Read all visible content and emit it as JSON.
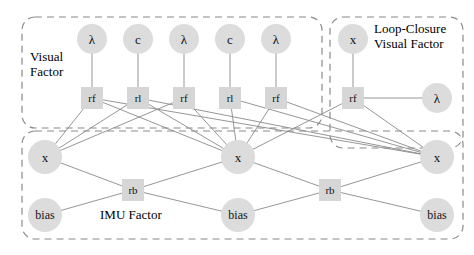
{
  "figure": {
    "width": 474,
    "height": 255,
    "background": "#ffffff",
    "node_fill_circle": "#dcdcdc",
    "node_fill_square": "#d6d6d6",
    "edge_color": "#8a8a8a",
    "group_border_color": "#8a8a8a"
  },
  "groups": [
    {
      "id": "visual-factor",
      "label": "Visual\nFactor",
      "x": 22,
      "y": 17,
      "w": 300,
      "h": 111,
      "label_x": 30,
      "label_y": 50,
      "font_size": 13
    },
    {
      "id": "loop-closure-visual-factor",
      "label": "Loop-Closure\nVisual Factor",
      "x": 330,
      "y": 17,
      "w": 133,
      "h": 131,
      "label_x": 374,
      "label_y": 22,
      "font_size": 13
    },
    {
      "id": "imu-factor",
      "label": "IMU Factor",
      "x": 22,
      "y": 131,
      "w": 441,
      "h": 108,
      "label_x": 100,
      "label_y": 208,
      "font_size": 13
    }
  ],
  "nodes": [
    {
      "id": "lambda1",
      "label": "λ",
      "shape": "circle",
      "cx": 92,
      "cy": 39,
      "r": 15,
      "font_size": 13
    },
    {
      "id": "c1",
      "label": "c",
      "shape": "circle",
      "cx": 138,
      "cy": 39,
      "r": 15,
      "font_size": 13
    },
    {
      "id": "lambda2",
      "label": "λ",
      "shape": "circle",
      "cx": 184,
      "cy": 39,
      "r": 15,
      "font_size": 13
    },
    {
      "id": "c2",
      "label": "c",
      "shape": "circle",
      "cx": 230,
      "cy": 39,
      "r": 15,
      "font_size": 13
    },
    {
      "id": "lambda3",
      "label": "λ",
      "shape": "circle",
      "cx": 276,
      "cy": 39,
      "r": 15,
      "font_size": 13
    },
    {
      "id": "rf1",
      "label": "rf",
      "shape": "square",
      "cx": 92,
      "cy": 98,
      "r": 11,
      "font_size": 11
    },
    {
      "id": "rl1",
      "label": "rl",
      "shape": "square",
      "cx": 138,
      "cy": 98,
      "r": 11,
      "font_size": 11
    },
    {
      "id": "rf2",
      "label": "rf",
      "shape": "square",
      "cx": 184,
      "cy": 98,
      "r": 11,
      "font_size": 11
    },
    {
      "id": "rl2",
      "label": "rl",
      "shape": "square",
      "cx": 230,
      "cy": 98,
      "r": 11,
      "font_size": 11
    },
    {
      "id": "rf3",
      "label": "rf",
      "shape": "square",
      "cx": 276,
      "cy": 98,
      "r": 11,
      "font_size": 11
    },
    {
      "id": "xlc",
      "label": "x",
      "shape": "circle",
      "cx": 353,
      "cy": 39,
      "r": 15,
      "font_size": 13
    },
    {
      "id": "rflc",
      "label": "rf",
      "shape": "square",
      "cx": 353,
      "cy": 98,
      "r": 11,
      "font_size": 11
    },
    {
      "id": "lambdalc",
      "label": "λ",
      "shape": "circle",
      "cx": 437,
      "cy": 98,
      "r": 15,
      "font_size": 13
    },
    {
      "id": "x1",
      "label": "x",
      "shape": "circle",
      "cx": 45,
      "cy": 157,
      "r": 17,
      "font_size": 13
    },
    {
      "id": "x2",
      "label": "x",
      "shape": "circle",
      "cx": 238,
      "cy": 157,
      "r": 17,
      "font_size": 13
    },
    {
      "id": "x3",
      "label": "x",
      "shape": "circle",
      "cx": 437,
      "cy": 157,
      "r": 17,
      "font_size": 13
    },
    {
      "id": "rb1",
      "label": "rb",
      "shape": "square",
      "cx": 133,
      "cy": 190,
      "r": 11,
      "font_size": 11
    },
    {
      "id": "rb2",
      "label": "rb",
      "shape": "square",
      "cx": 330,
      "cy": 190,
      "r": 11,
      "font_size": 11
    },
    {
      "id": "bias1",
      "label": "bias",
      "shape": "circle",
      "cx": 45,
      "cy": 215,
      "r": 17,
      "font_size": 12
    },
    {
      "id": "bias2",
      "label": "bias",
      "shape": "circle",
      "cx": 238,
      "cy": 215,
      "r": 17,
      "font_size": 12
    },
    {
      "id": "bias3",
      "label": "bias",
      "shape": "circle",
      "cx": 437,
      "cy": 215,
      "r": 17,
      "font_size": 12
    }
  ],
  "edges": [
    {
      "from": "lambda1",
      "to": "rf1"
    },
    {
      "from": "c1",
      "to": "rl1"
    },
    {
      "from": "lambda2",
      "to": "rf2"
    },
    {
      "from": "c2",
      "to": "rl2"
    },
    {
      "from": "lambda3",
      "to": "rf3"
    },
    {
      "from": "rf1",
      "to": "x1"
    },
    {
      "from": "rf1",
      "to": "x2"
    },
    {
      "from": "rl1",
      "to": "x1"
    },
    {
      "from": "rl1",
      "to": "x2"
    },
    {
      "from": "rf2",
      "to": "x1"
    },
    {
      "from": "rf2",
      "to": "x2"
    },
    {
      "from": "rl2",
      "to": "x2"
    },
    {
      "from": "rl2",
      "to": "x3"
    },
    {
      "from": "rf3",
      "to": "x2"
    },
    {
      "from": "rf3",
      "to": "x3"
    },
    {
      "from": "rf1",
      "to": "x3"
    },
    {
      "from": "rl1",
      "to": "x3"
    },
    {
      "from": "xlc",
      "to": "rflc"
    },
    {
      "from": "rflc",
      "to": "lambdalc"
    },
    {
      "from": "rflc",
      "to": "x2"
    },
    {
      "from": "rflc",
      "to": "x3"
    },
    {
      "from": "x1",
      "to": "rb1"
    },
    {
      "from": "rb1",
      "to": "x2"
    },
    {
      "from": "bias1",
      "to": "rb1"
    },
    {
      "from": "rb1",
      "to": "bias2"
    },
    {
      "from": "x2",
      "to": "rb2"
    },
    {
      "from": "rb2",
      "to": "x3"
    },
    {
      "from": "bias2",
      "to": "rb2"
    },
    {
      "from": "rb2",
      "to": "bias3"
    }
  ]
}
